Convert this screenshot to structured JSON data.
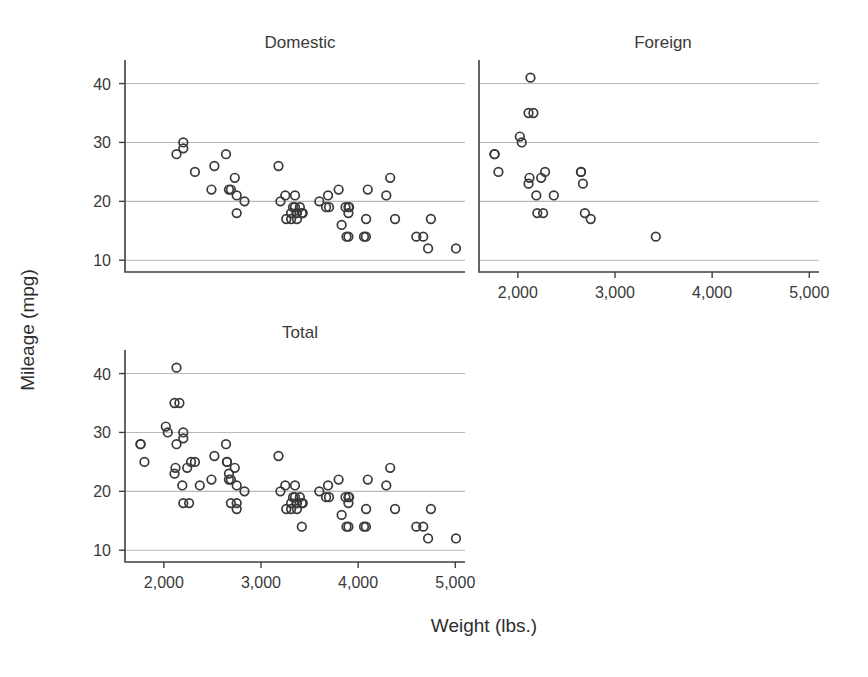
{
  "chart_data": {
    "type": "scatter",
    "title": "",
    "xlabel": "Weight (lbs.)",
    "ylabel": "Mileage (mpg)",
    "xlim": [
      1600,
      5100
    ],
    "ylim": [
      8,
      44
    ],
    "xticks": [
      2000,
      3000,
      4000,
      5000
    ],
    "xtick_labels": [
      "2,000",
      "3,000",
      "4,000",
      "5,000"
    ],
    "yticks": [
      10,
      20,
      30,
      40
    ],
    "ytick_labels": [
      "10",
      "20",
      "30",
      "40"
    ],
    "grid": "horizontal",
    "legend": "none",
    "marker": "open-circle",
    "marker_color": "#3a3a3a",
    "grid_color": "#b9b9b9",
    "axis_color": "#3f3f3f",
    "panels": [
      {
        "name": "domestic",
        "title": "Domestic",
        "n": 52,
        "x": [
          4099,
          4749,
          3799,
          4082,
          3900,
          4290,
          4330,
          3907,
          3690,
          3180,
          3400,
          3350,
          4380,
          4599,
          5007,
          3870,
          3600,
          3330,
          3430,
          3900,
          4060,
          3365,
          3200,
          4670,
          3880,
          3900,
          2730,
          2690,
          2320,
          2750,
          2130,
          3250,
          4080,
          3670,
          3350,
          2640,
          3830,
          2750,
          3310,
          2200,
          2520,
          2830,
          3310,
          3370,
          2200,
          2670,
          2490,
          4720,
          3420,
          3260,
          3700,
          3370
        ],
        "y": [
          22,
          17,
          22,
          17,
          18,
          21,
          24,
          19,
          21,
          26,
          19,
          21,
          17,
          14,
          12,
          19,
          20,
          19,
          18,
          14,
          14,
          18,
          20,
          14,
          14,
          19,
          24,
          22,
          25,
          21,
          28,
          21,
          14,
          19,
          19,
          28,
          16,
          18,
          17,
          30,
          26,
          20,
          18,
          17,
          29,
          22,
          22,
          12,
          18,
          17,
          19,
          18
        ]
      },
      {
        "name": "foreign",
        "title": "Foreign",
        "n": 22,
        "x": [
          2110,
          2650,
          2110,
          2120,
          2160,
          2670,
          2370,
          2280,
          2750,
          2130,
          2650,
          1760,
          2690,
          2200,
          2190,
          2240,
          2260,
          1800,
          1760,
          2040,
          2020,
          3420
        ],
        "y": [
          23,
          25,
          35,
          24,
          35,
          23,
          21,
          25,
          17,
          41,
          25,
          28,
          18,
          18,
          21,
          24,
          18,
          25,
          28,
          30,
          31,
          14
        ]
      },
      {
        "name": "total",
        "title": "Total",
        "n": 74,
        "x": [
          4099,
          4749,
          3799,
          4082,
          3900,
          4290,
          4330,
          3907,
          3690,
          3180,
          3400,
          3350,
          4380,
          4599,
          5007,
          3870,
          3600,
          3330,
          3430,
          3900,
          4060,
          3365,
          3200,
          4670,
          3880,
          3900,
          2730,
          2690,
          2320,
          2750,
          2130,
          3250,
          4080,
          3670,
          3350,
          2640,
          3830,
          2750,
          3310,
          2200,
          2520,
          2830,
          3310,
          3370,
          2200,
          2670,
          2490,
          4720,
          3420,
          3260,
          3700,
          3370,
          2110,
          2650,
          2110,
          2120,
          2160,
          2670,
          2370,
          2280,
          2750,
          2130,
          2650,
          1760,
          2690,
          2200,
          2190,
          2240,
          2260,
          1800,
          1760,
          2040,
          2020,
          3420
        ],
        "y": [
          22,
          17,
          22,
          17,
          18,
          21,
          24,
          19,
          21,
          26,
          19,
          21,
          17,
          14,
          12,
          19,
          20,
          19,
          18,
          14,
          14,
          18,
          20,
          14,
          14,
          19,
          24,
          22,
          25,
          21,
          28,
          21,
          14,
          19,
          19,
          28,
          16,
          18,
          17,
          30,
          26,
          20,
          18,
          17,
          29,
          22,
          22,
          12,
          18,
          17,
          19,
          18,
          23,
          25,
          35,
          24,
          35,
          23,
          21,
          25,
          17,
          41,
          25,
          28,
          18,
          18,
          21,
          24,
          18,
          25,
          28,
          30,
          31,
          14
        ]
      }
    ]
  }
}
